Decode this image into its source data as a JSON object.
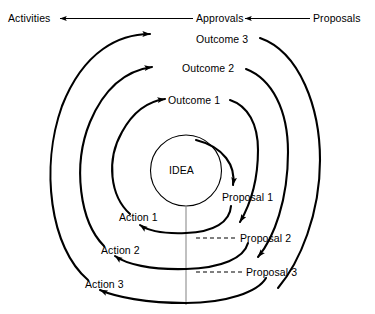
{
  "diagram": {
    "center_label": "IDEA",
    "stroke_color": "#000000",
    "dashed_color": "#000000",
    "axis_color": "#808080",
    "background_color": "#ffffff",
    "top_flow": {
      "nodes": [
        {
          "id": "activities",
          "label": "Activities"
        },
        {
          "id": "approvals",
          "label": "Approvals"
        },
        {
          "id": "proposals",
          "label": "Proposals"
        }
      ],
      "direction": "right-to-left",
      "arrow_labels": [
        "arrow-to-activities",
        "arrow-to-approvals"
      ]
    },
    "outcomes": [
      {
        "id": "outcome-1",
        "label": "Outcome 1"
      },
      {
        "id": "outcome-2",
        "label": "Outcome 2"
      },
      {
        "id": "outcome-3",
        "label": "Outcome 3"
      }
    ],
    "proposals": [
      {
        "id": "proposal-1",
        "label": "Proposal 1"
      },
      {
        "id": "proposal-2",
        "label": "Proposal 2"
      },
      {
        "id": "proposal-3",
        "label": "Proposal 3"
      }
    ],
    "actions": [
      {
        "id": "action-1",
        "label": "Action 1"
      },
      {
        "id": "action-2",
        "label": "Action 2"
      },
      {
        "id": "action-3",
        "label": "Action 3"
      }
    ],
    "dashed_links": [
      {
        "from": "action-1-arc",
        "to": "proposal-2"
      },
      {
        "from": "action-2-arc",
        "to": "proposal-3"
      }
    ]
  }
}
